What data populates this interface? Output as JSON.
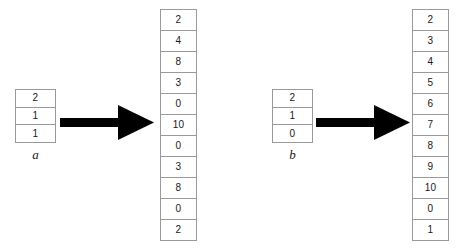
{
  "diagram": {
    "groups": [
      {
        "id": "group-a",
        "label": "a",
        "input": {
          "name": "input-array-a",
          "cells": [
            "2",
            "1",
            "1"
          ]
        },
        "arrow": {
          "name": "arrow-a",
          "direction": "right"
        },
        "output": {
          "name": "output-array-a",
          "cells": [
            "2",
            "4",
            "8",
            "3",
            "0",
            "10",
            "0",
            "3",
            "8",
            "0",
            "2"
          ]
        }
      },
      {
        "id": "group-b",
        "label": "b",
        "input": {
          "name": "input-array-b",
          "cells": [
            "2",
            "1",
            "0"
          ]
        },
        "arrow": {
          "name": "arrow-b",
          "direction": "right"
        },
        "output": {
          "name": "output-array-b",
          "cells": [
            "2",
            "3",
            "4",
            "5",
            "6",
            "7",
            "8",
            "9",
            "10",
            "0",
            "1"
          ]
        }
      }
    ],
    "colors": {
      "cell_border": "#9a9a9a",
      "cell_background": "#ffffff",
      "text": "#1a1a1a",
      "arrow": "#000000",
      "page_background": "#ffffff"
    }
  }
}
